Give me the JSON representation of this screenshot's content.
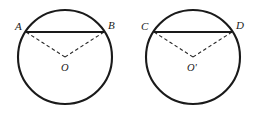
{
  "figure": {
    "background_color": "#ffffff",
    "stroke_color": "#1a1a1a",
    "dash_color": "#2a2a2a",
    "width": 262,
    "height": 114
  },
  "circles": [
    {
      "id": "left-circle",
      "center_label": "O",
      "center_x": 65,
      "center_y": 57,
      "radius": 47,
      "chord": {
        "label": "AB",
        "style": "solid",
        "start_label": "A",
        "end_label": "B",
        "start_x": 26,
        "start_y": 32,
        "end_x": 104,
        "end_y": 32
      },
      "radii": [
        {
          "name": "OA",
          "style": "dashed",
          "from": "O",
          "to": "A"
        },
        {
          "name": "OB",
          "style": "dashed",
          "from": "O",
          "to": "B"
        }
      ],
      "point_labels": [
        {
          "name": "A",
          "text": "A",
          "x": 15,
          "y": 30
        },
        {
          "name": "B",
          "text": "B",
          "x": 108,
          "y": 29
        },
        {
          "name": "O",
          "text": "O",
          "x": 61,
          "y": 71
        }
      ]
    },
    {
      "id": "right-circle",
      "center_label": "O'",
      "center_x": 193,
      "center_y": 57,
      "radius": 47,
      "chord": {
        "label": "CD",
        "style": "solid",
        "start_label": "C",
        "end_label": "D",
        "start_x": 154,
        "start_y": 32,
        "end_x": 232,
        "end_y": 32
      },
      "radii": [
        {
          "name": "O'C",
          "style": "dashed",
          "from": "O'",
          "to": "C"
        },
        {
          "name": "O'D",
          "style": "dashed",
          "from": "O'",
          "to": "D"
        }
      ],
      "point_labels": [
        {
          "name": "C",
          "text": "C",
          "x": 141,
          "y": 30
        },
        {
          "name": "D",
          "text": "D",
          "x": 236,
          "y": 29
        },
        {
          "name": "Oprime",
          "text": "O'",
          "x": 187,
          "y": 71
        }
      ]
    }
  ]
}
